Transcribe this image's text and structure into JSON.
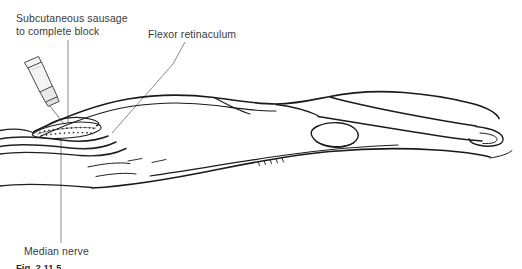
{
  "figure": {
    "kind": "medical-line-illustration",
    "background_color": "#ffffff",
    "ink_color": "#1a1a1a",
    "leader_line_color": "#8c8c8c",
    "text_color": "#3b3b3b",
    "syringe_fill": "#f2f2f2",
    "deposit_fill": "#ffffff"
  },
  "labels": {
    "subcutaneous": {
      "line1": "Subcutaneous sausage",
      "line2": "to complete block"
    },
    "flexor": "Flexor retinaculum",
    "median": "Median nerve"
  },
  "caption": "Fig. 2.11.5",
  "icons": {
    "syringe": "syringe-icon",
    "needle": "needle-icon",
    "deposit": "anesthetic-deposit-icon"
  }
}
